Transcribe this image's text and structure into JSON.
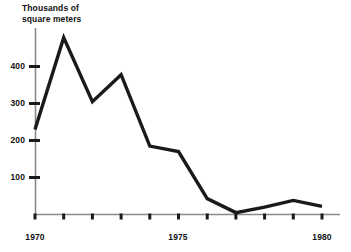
{
  "chart_data": {
    "type": "line",
    "title_line1": "Thousands of",
    "title_line2": "square meters",
    "xlabel": "",
    "ylabel": "Thousands of square meters",
    "x": [
      1970,
      1971,
      1972,
      1973,
      1974,
      1975,
      1976,
      1977,
      1978,
      1979,
      1980
    ],
    "categories": [
      "1970",
      "1971",
      "1972",
      "1973",
      "1974",
      "1975",
      "1976",
      "1977",
      "1978",
      "1979",
      "1980"
    ],
    "values": [
      230,
      478,
      305,
      378,
      185,
      170,
      43,
      5,
      20,
      38,
      22
    ],
    "series": [
      {
        "name": "Floor space",
        "values": [
          230,
          478,
          305,
          378,
          185,
          170,
          43,
          5,
          20,
          38,
          22
        ]
      }
    ],
    "xlim": [
      1970,
      1980
    ],
    "ylim": [
      0,
      500
    ],
    "ytick_values": [
      100,
      200,
      300,
      400
    ],
    "ytick_labels": [
      "100",
      "200",
      "300",
      "400"
    ],
    "xtick_values": [
      1970,
      1971,
      1972,
      1973,
      1974,
      1975,
      1976,
      1977,
      1978,
      1979,
      1980
    ],
    "xtick_labels_shown": [
      "1970",
      "1975",
      "1980"
    ],
    "grid": false,
    "legend": false,
    "legend_position": "none",
    "line_color": "#1a1a1a",
    "axis_color": "#8a8a8a",
    "background_color": "#ffffff"
  },
  "axis": {
    "y_labels": [
      "400",
      "300",
      "200",
      "100"
    ],
    "x_labels": [
      "1970",
      "1975",
      "1980"
    ]
  }
}
